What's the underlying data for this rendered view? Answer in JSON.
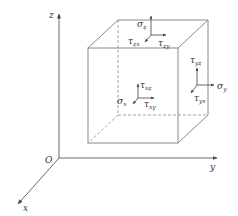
{
  "diagram": {
    "type": "3D stress element",
    "axes": {
      "origin_label": "O",
      "x_label": "x",
      "y_label": "y",
      "z_label": "z"
    },
    "faces": {
      "x_face": {
        "normal": {
          "symbol": "σ",
          "sub": "x"
        },
        "shear_1": {
          "symbol": "τ",
          "sub": "xz"
        },
        "shear_2": {
          "symbol": "τ",
          "sub": "xy"
        }
      },
      "y_face": {
        "normal": {
          "symbol": "σ",
          "sub": "y"
        },
        "shear_1": {
          "symbol": "τ",
          "sub": "yz"
        },
        "shear_2": {
          "symbol": "τ",
          "sub": "yx"
        }
      },
      "z_face": {
        "normal": {
          "symbol": "σ",
          "sub": "z"
        },
        "shear_1": {
          "symbol": "τ",
          "sub": "zx"
        },
        "shear_2": {
          "symbol": "τ",
          "sub": "zy"
        }
      }
    },
    "colors": {
      "edges": "#8a8a8a",
      "axes": "#6a6a6a",
      "text": "#333333"
    }
  }
}
